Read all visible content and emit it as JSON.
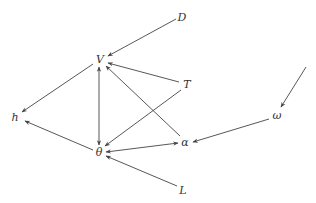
{
  "diagram": {
    "type": "directed-graph",
    "nodes": [
      {
        "id": "D",
        "label": "D",
        "x": 182,
        "y": 17
      },
      {
        "id": "V",
        "label": "V",
        "x": 100,
        "y": 59
      },
      {
        "id": "T",
        "label": "T",
        "x": 187,
        "y": 84
      },
      {
        "id": "h",
        "label": "h",
        "x": 15,
        "y": 117
      },
      {
        "id": "omega",
        "label": "ω",
        "x": 277,
        "y": 115
      },
      {
        "id": "alpha",
        "label": "α",
        "x": 185,
        "y": 142
      },
      {
        "id": "theta",
        "label": "θ",
        "x": 99,
        "y": 152
      },
      {
        "id": "L",
        "label": "L",
        "x": 183,
        "y": 190
      }
    ],
    "edges": [
      {
        "from": "D",
        "to": "V",
        "x1": 176,
        "y1": 19,
        "x2": 108,
        "y2": 56,
        "start_arrow": false,
        "end_arrow": true
      },
      {
        "from": "T",
        "to": "V",
        "x1": 179,
        "y1": 82,
        "x2": 108,
        "y2": 63,
        "start_arrow": false,
        "end_arrow": true
      },
      {
        "from": "alpha",
        "to": "V",
        "x1": 180,
        "y1": 136,
        "x2": 106,
        "y2": 66,
        "start_arrow": false,
        "end_arrow": true
      },
      {
        "from": "V",
        "to": "theta",
        "x1": 99,
        "y1": 67,
        "x2": 99,
        "y2": 145,
        "start_arrow": true,
        "end_arrow": true
      },
      {
        "from": "V",
        "to": "h",
        "x1": 93,
        "y1": 64,
        "x2": 22,
        "y2": 112,
        "start_arrow": false,
        "end_arrow": true
      },
      {
        "from": "theta",
        "to": "h",
        "x1": 93,
        "y1": 150,
        "x2": 25,
        "y2": 121,
        "start_arrow": false,
        "end_arrow": true
      },
      {
        "from": "T",
        "to": "theta",
        "x1": 181,
        "y1": 90,
        "x2": 105,
        "y2": 146,
        "start_arrow": false,
        "end_arrow": true
      },
      {
        "from": "theta",
        "to": "alpha",
        "x1": 106,
        "y1": 152,
        "x2": 178,
        "y2": 143,
        "start_arrow": true,
        "end_arrow": true
      },
      {
        "from": "omega",
        "to": "alpha",
        "x1": 269,
        "y1": 119,
        "x2": 193,
        "y2": 142,
        "start_arrow": false,
        "end_arrow": true
      },
      {
        "from": "L",
        "to": "theta",
        "x1": 177,
        "y1": 186,
        "x2": 106,
        "y2": 156,
        "start_arrow": false,
        "end_arrow": true
      },
      {
        "from": "external",
        "to": "omega",
        "x1": 306,
        "y1": 67,
        "x2": 281,
        "y2": 107,
        "start_arrow": false,
        "end_arrow": true
      }
    ]
  }
}
